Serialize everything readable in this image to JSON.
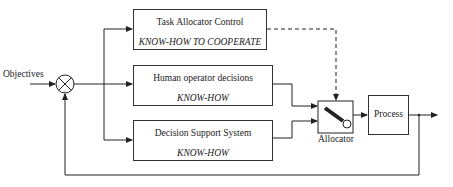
{
  "diagram": {
    "input_label": "Objectives",
    "summing_junction": {
      "signs": [
        "+",
        "-"
      ]
    },
    "blocks": [
      {
        "id": "task-allocator",
        "title": "Task Allocator Control",
        "subtitle": "KNOW-HOW TO COOPERATE"
      },
      {
        "id": "human-operator",
        "title": "Human operator decisions",
        "subtitle": "KNOW-HOW"
      },
      {
        "id": "dss",
        "title": "Decision Support System",
        "subtitle": "KNOW-HOW"
      }
    ],
    "allocator_label": "Allocator",
    "process_label": "Process",
    "connections": [
      "Objectives -> summing junction",
      "summing junction -> Task Allocator Control",
      "summing junction -> Human operator decisions",
      "summing junction -> Decision Support System",
      "Task Allocator Control -> Allocator (dashed)",
      "Human operator decisions -> Allocator",
      "Decision Support System -> Allocator",
      "Allocator -> Process",
      "Process -> output",
      "output -> summing junction (feedback)"
    ]
  }
}
